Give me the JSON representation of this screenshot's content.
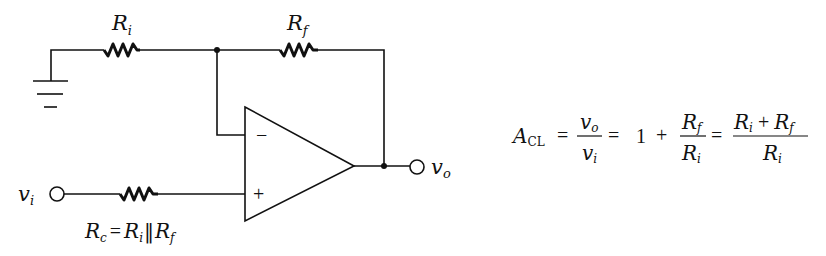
{
  "diagram": {
    "components": {
      "ri": {
        "label": "R",
        "sub": "i"
      },
      "rf": {
        "label": "R",
        "sub": "f"
      },
      "rc": {
        "label": "R",
        "sub": "c"
      },
      "opamp": {
        "minus": "−",
        "plus": "+"
      },
      "ground": {
        "name": "ground"
      },
      "input": {
        "label": "v",
        "sub": "i"
      },
      "output": {
        "label": "v",
        "sub": "o"
      }
    },
    "rc_eq": {
      "lhs": "R",
      "lhs_sub": "c",
      "eq": "=",
      "a": "R",
      "a_sub": "i",
      "par": "‖",
      "b": "R",
      "b_sub": "f"
    },
    "gain_eq": {
      "a": "A",
      "a_sub": "CL",
      "eq1": "=",
      "f1_num": "v",
      "f1_num_sub": "o",
      "f1_den": "v",
      "f1_den_sub": "i",
      "eq2": "=",
      "one": "1",
      "plus1": "+",
      "f2_num": "R",
      "f2_num_sub": "f",
      "f2_den": "R",
      "f2_den_sub": "i",
      "eq3": "=",
      "f3_num_a": "R",
      "f3_num_a_sub": "i",
      "f3_plus": "+",
      "f3_num_b": "R",
      "f3_num_b_sub": "f",
      "f3_den": "R",
      "f3_den_sub": "i"
    }
  }
}
